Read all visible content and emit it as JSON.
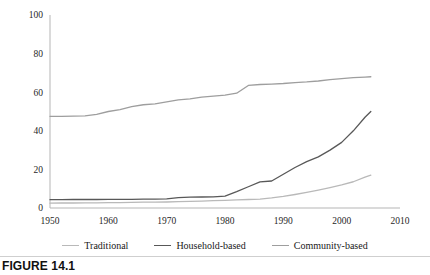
{
  "figure": {
    "caption": "FIGURE 14.1"
  },
  "colors": {
    "traditional": "#b9b9b9",
    "household_based": "#585858",
    "community_based": "#9e9e9e",
    "axis": "#b5b5b5",
    "text": "#1a1a1a",
    "background": "#ffffff"
  },
  "legend": {
    "position": "bottom",
    "items": [
      {
        "label": "Traditional",
        "color": "#b9b9b9"
      },
      {
        "label": "Household-based",
        "color": "#585858"
      },
      {
        "label": "Community-based",
        "color": "#9e9e9e"
      }
    ]
  },
  "chart_data": {
    "type": "line",
    "title": "",
    "xlabel": "",
    "ylabel": "",
    "xlim": [
      1950,
      2010
    ],
    "ylim": [
      0,
      100
    ],
    "grid": false,
    "xticks": [
      1950,
      1960,
      1970,
      1980,
      1990,
      2000,
      2010
    ],
    "yticks": [
      0,
      20,
      40,
      60,
      80,
      100
    ],
    "xtick_labels": [
      "1950",
      "1960",
      "1970",
      "1980",
      "1990",
      "2000",
      "2010"
    ],
    "ytick_labels": [
      "0",
      "20",
      "40",
      "60",
      "80",
      "100"
    ],
    "x": [
      1950,
      1952,
      1954,
      1956,
      1958,
      1960,
      1962,
      1964,
      1966,
      1968,
      1970,
      1972,
      1974,
      1976,
      1978,
      1980,
      1982,
      1984,
      1986,
      1988,
      1990,
      1992,
      1994,
      1996,
      1998,
      2000,
      2002,
      2004,
      2005
    ],
    "series": [
      {
        "name": "Traditional",
        "color": "#b9b9b9",
        "values": [
          2.5,
          2.6,
          2.6,
          2.7,
          2.7,
          2.8,
          2.8,
          2.9,
          3.0,
          3.0,
          3.1,
          3.3,
          3.4,
          3.6,
          3.8,
          4.0,
          4.2,
          4.4,
          4.6,
          5.2,
          6.0,
          7.0,
          8.1,
          9.3,
          10.6,
          12.0,
          13.6,
          16.0,
          17.0
        ]
      },
      {
        "name": "Household-based",
        "color": "#585858",
        "values": [
          4.3,
          4.3,
          4.4,
          4.4,
          4.4,
          4.5,
          4.5,
          4.5,
          4.6,
          4.6,
          4.7,
          5.4,
          5.6,
          5.7,
          5.8,
          6.2,
          8.5,
          11.0,
          13.5,
          14.0,
          17.5,
          21.0,
          24.0,
          26.5,
          30.0,
          34.0,
          40.0,
          47.0,
          50.0
        ]
      },
      {
        "name": "Community-based",
        "color": "#9e9e9e",
        "values": [
          47.5,
          47.5,
          47.6,
          47.7,
          48.5,
          50.0,
          51.0,
          52.5,
          53.5,
          54.0,
          55.0,
          56.0,
          56.5,
          57.5,
          58.0,
          58.5,
          59.5,
          63.5,
          64.0,
          64.2,
          64.5,
          65.0,
          65.3,
          65.8,
          66.5,
          67.0,
          67.5,
          67.8,
          68.0
        ]
      }
    ]
  }
}
